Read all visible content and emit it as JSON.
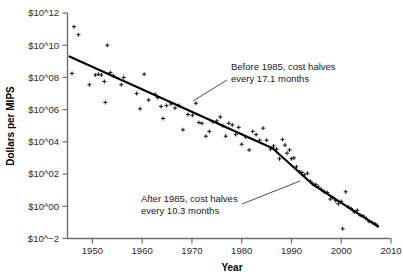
{
  "chart_data": {
    "type": "scatter",
    "title": "",
    "xlabel": "Year",
    "ylabel": "Dollars per MIPS",
    "xlim": [
      1945,
      2010
    ],
    "ylim": [
      -2,
      12
    ],
    "yscale": "log10-exponent",
    "grid": false,
    "legend": null,
    "xticks": [
      1950,
      1960,
      1970,
      1980,
      1990,
      2000,
      2010
    ],
    "xticklabels": [
      "1950",
      "1960",
      "1970",
      "1980",
      "1990",
      "2000",
      "2010"
    ],
    "yticks": [
      12,
      10,
      8,
      6,
      4,
      2,
      0,
      -2
    ],
    "yticklabels": [
      "$10^12",
      "$10^10",
      "$10^08",
      "$10^06",
      "$10^04",
      "$10^02",
      "$10^00",
      "$10^−2"
    ],
    "marker": "plus",
    "points": [
      {
        "x": 1946.3,
        "y": 11.15
      },
      {
        "x": 1947.2,
        "y": 10.65
      },
      {
        "x": 1945.9,
        "y": 8.25
      },
      {
        "x": 1949.4,
        "y": 7.55
      },
      {
        "x": 1950.6,
        "y": 8.15
      },
      {
        "x": 1951.2,
        "y": 8.2
      },
      {
        "x": 1951.8,
        "y": 8.15
      },
      {
        "x": 1952.4,
        "y": 7.75
      },
      {
        "x": 1953.0,
        "y": 10.0
      },
      {
        "x": 1953.6,
        "y": 8.3
      },
      {
        "x": 1954.2,
        "y": 8.1
      },
      {
        "x": 1952.6,
        "y": 6.45
      },
      {
        "x": 1955.8,
        "y": 7.55
      },
      {
        "x": 1956.3,
        "y": 8.0
      },
      {
        "x": 1958.9,
        "y": 7.0
      },
      {
        "x": 1959.6,
        "y": 6.05
      },
      {
        "x": 1960.4,
        "y": 8.2
      },
      {
        "x": 1961.3,
        "y": 6.6
      },
      {
        "x": 1962.6,
        "y": 6.95
      },
      {
        "x": 1963.1,
        "y": 6.75
      },
      {
        "x": 1963.8,
        "y": 6.2
      },
      {
        "x": 1964.2,
        "y": 5.45
      },
      {
        "x": 1964.9,
        "y": 6.25
      },
      {
        "x": 1965.8,
        "y": 6.35
      },
      {
        "x": 1966.6,
        "y": 6.1
      },
      {
        "x": 1967.4,
        "y": 6.25
      },
      {
        "x": 1968.2,
        "y": 4.75
      },
      {
        "x": 1969.2,
        "y": 5.7
      },
      {
        "x": 1970.1,
        "y": 5.65
      },
      {
        "x": 1970.8,
        "y": 6.4
      },
      {
        "x": 1971.4,
        "y": 5.2
      },
      {
        "x": 1972.0,
        "y": 5.15
      },
      {
        "x": 1972.8,
        "y": 4.35
      },
      {
        "x": 1973.5,
        "y": 4.65
      },
      {
        "x": 1974.2,
        "y": 5.25
      },
      {
        "x": 1975.0,
        "y": 5.3
      },
      {
        "x": 1975.7,
        "y": 5.55
      },
      {
        "x": 1976.2,
        "y": 5.0
      },
      {
        "x": 1976.8,
        "y": 4.35
      },
      {
        "x": 1977.4,
        "y": 5.15
      },
      {
        "x": 1978.1,
        "y": 5.05
      },
      {
        "x": 1978.8,
        "y": 4.45
      },
      {
        "x": 1979.4,
        "y": 4.9
      },
      {
        "x": 1980.0,
        "y": 3.85
      },
      {
        "x": 1980.8,
        "y": 4.3
      },
      {
        "x": 1981.5,
        "y": 3.5
      },
      {
        "x": 1982.2,
        "y": 4.65
      },
      {
        "x": 1982.9,
        "y": 4.45
      },
      {
        "x": 1983.6,
        "y": 4.1
      },
      {
        "x": 1984.3,
        "y": 4.85
      },
      {
        "x": 1985.0,
        "y": 4.1
      },
      {
        "x": 1985.8,
        "y": 3.55
      },
      {
        "x": 1986.4,
        "y": 3.75
      },
      {
        "x": 1987.0,
        "y": 3.55
      },
      {
        "x": 1987.6,
        "y": 2.95
      },
      {
        "x": 1988.2,
        "y": 4.15
      },
      {
        "x": 1988.7,
        "y": 3.8
      },
      {
        "x": 1989.1,
        "y": 3.3
      },
      {
        "x": 1989.6,
        "y": 3.5
      },
      {
        "x": 1990.0,
        "y": 2.95
      },
      {
        "x": 1990.5,
        "y": 3.0
      },
      {
        "x": 1991.0,
        "y": 2.45
      },
      {
        "x": 1991.6,
        "y": 2.15
      },
      {
        "x": 1992.1,
        "y": 2.1
      },
      {
        "x": 1992.6,
        "y": 1.95
      },
      {
        "x": 1993.2,
        "y": 2.05
      },
      {
        "x": 1993.8,
        "y": 1.55
      },
      {
        "x": 1994.3,
        "y": 1.4
      },
      {
        "x": 1994.9,
        "y": 1.35
      },
      {
        "x": 1995.4,
        "y": 1.2
      },
      {
        "x": 1996.0,
        "y": 1.05
      },
      {
        "x": 1996.6,
        "y": 0.9
      },
      {
        "x": 1997.2,
        "y": 0.85
      },
      {
        "x": 1997.8,
        "y": 0.45
      },
      {
        "x": 1998.3,
        "y": 0.55
      },
      {
        "x": 1998.9,
        "y": 0.35
      },
      {
        "x": 1999.4,
        "y": 0.15
      },
      {
        "x": 2000.0,
        "y": 0.3
      },
      {
        "x": 2000.3,
        "y": -1.4
      },
      {
        "x": 2000.9,
        "y": 0.9
      },
      {
        "x": 2001.4,
        "y": -0.05
      },
      {
        "x": 2002.0,
        "y": -0.15
      },
      {
        "x": 2002.6,
        "y": -0.35
      },
      {
        "x": 2003.2,
        "y": -0.25
      },
      {
        "x": 2003.8,
        "y": -0.55
      },
      {
        "x": 2004.4,
        "y": -0.6
      },
      {
        "x": 2005.0,
        "y": -0.75
      },
      {
        "x": 2005.6,
        "y": -0.95
      },
      {
        "x": 2006.2,
        "y": -1.0
      },
      {
        "x": 2006.8,
        "y": -1.1
      },
      {
        "x": 2007.2,
        "y": -1.2
      }
    ],
    "trend_segments": [
      {
        "name": "before-1985",
        "points": [
          [
            1945.4,
            9.3
          ],
          [
            1986.2,
            3.6
          ]
        ],
        "halving_months": 17.1
      },
      {
        "name": "after-1985",
        "points": [
          [
            1986.2,
            3.6
          ],
          [
            1994.3,
            1.35
          ],
          [
            2007.4,
            -1.25
          ]
        ],
        "halving_months": 10.3
      }
    ],
    "annotations": [
      {
        "name": "before-1985-note",
        "lines": [
          "Before 1985, cost halves",
          "every 17.1 months"
        ],
        "text_x": 231,
        "text_y": 70,
        "leader_from": [
          227,
          80
        ],
        "leader_to": [
          193,
          101
        ]
      },
      {
        "name": "after-1985-note",
        "lines": [
          "After 1985, cost halves",
          "every 10.3 months"
        ],
        "text_x": 141,
        "text_y": 202,
        "leader_from": [
          242,
          204
        ],
        "leader_to": [
          300,
          181
        ]
      }
    ]
  }
}
